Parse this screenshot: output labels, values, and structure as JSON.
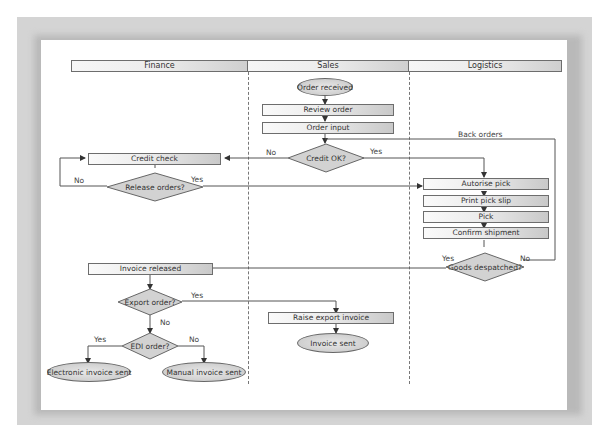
{
  "lanes": [
    {
      "label": "Finance"
    },
    {
      "label": "Sales"
    },
    {
      "label": "Logistics"
    }
  ],
  "nodes": {
    "order_received": "Order received",
    "review_order": "Review order",
    "order_input": "Order input",
    "credit_ok": "Credit OK?",
    "credit_check": "Credit check",
    "release_orders": "Release orders?",
    "autorise_pick": "Autorise pick",
    "print_pick_slip": "Print pick slip",
    "pick": "Pick",
    "confirm_shipment": "Confirm shipment",
    "goods_despatched": "Goods despatched?",
    "invoice_released": "Invoice released",
    "export_order": "Export order?",
    "edi_order": "EDI order?",
    "raise_export_invoice": "Raise export invoice",
    "invoice_sent": "Invoice sent",
    "electronic_invoice_sent": "Electronic invoice sent",
    "manual_invoice_sent": "Manual invoice sent"
  },
  "edge_labels": {
    "credit_no": "No",
    "credit_yes": "Yes",
    "release_no": "No",
    "release_yes": "Yes",
    "back_orders": "Back orders",
    "despatched_yes": "Yes",
    "despatched_no": "No",
    "export_yes": "Yes",
    "export_no": "No",
    "edi_yes": "Yes",
    "edi_no": "No"
  },
  "colors": {
    "frame": "#d4d4d4",
    "paper": "#ffffff",
    "line": "#555555",
    "box_light": "#fafafa",
    "box_dark": "#c9c9c9"
  }
}
